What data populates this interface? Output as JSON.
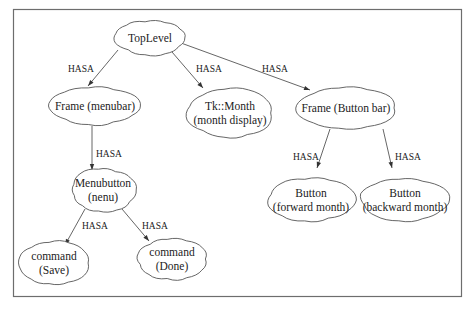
{
  "diagram": {
    "type": "composition-tree",
    "relation_label": "HASA",
    "nodes": [
      {
        "id": "toplevel",
        "lines": [
          "TopLevel"
        ]
      },
      {
        "id": "frame-menubar",
        "lines": [
          "Frame (menubar)"
        ]
      },
      {
        "id": "tk-month",
        "lines": [
          "Tk::Month",
          "(month display)"
        ]
      },
      {
        "id": "frame-buttonbar",
        "lines": [
          "Frame (Button bar)"
        ]
      },
      {
        "id": "menubutton",
        "lines": [
          "Menubutton",
          "(nenu)"
        ]
      },
      {
        "id": "button-forward",
        "lines": [
          "Button",
          "(forward month)"
        ]
      },
      {
        "id": "button-backward",
        "lines": [
          "Button",
          "(backward month)"
        ]
      },
      {
        "id": "command-save",
        "lines": [
          "command",
          "(Save)"
        ]
      },
      {
        "id": "command-done",
        "lines": [
          "command",
          "(Done)"
        ]
      }
    ],
    "edges": [
      {
        "from": "toplevel",
        "to": "frame-menubar",
        "label": "HASA"
      },
      {
        "from": "toplevel",
        "to": "tk-month",
        "label": "HASA"
      },
      {
        "from": "toplevel",
        "to": "frame-buttonbar",
        "label": "HASA"
      },
      {
        "from": "frame-menubar",
        "to": "menubutton",
        "label": "HASA"
      },
      {
        "from": "frame-buttonbar",
        "to": "button-forward",
        "label": "HASA"
      },
      {
        "from": "frame-buttonbar",
        "to": "button-backward",
        "label": "HASA"
      },
      {
        "from": "menubutton",
        "to": "command-save",
        "label": "HASA"
      },
      {
        "from": "menubutton",
        "to": "command-done",
        "label": "HASA"
      }
    ]
  }
}
